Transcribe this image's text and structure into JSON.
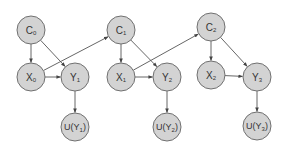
{
  "diagram": {
    "type": "dynamic-bayesian-network",
    "colors": {
      "node_fill": "#d3d3d3",
      "node_stroke": "#707070",
      "edge": "#555555",
      "text": "#333333",
      "background": "#ffffff"
    },
    "nodes": [
      {
        "id": "C0",
        "base": "C",
        "sub": "0",
        "wrap": false,
        "cx": 31,
        "cy": 30
      },
      {
        "id": "X0",
        "base": "X",
        "sub": "0",
        "wrap": false,
        "cx": 31,
        "cy": 77
      },
      {
        "id": "Y1",
        "base": "Y",
        "sub": "1",
        "wrap": false,
        "cx": 75,
        "cy": 77
      },
      {
        "id": "UY1",
        "base": "Y",
        "sub": "1",
        "wrap": true,
        "cx": 75,
        "cy": 127
      },
      {
        "id": "C1",
        "base": "C",
        "sub": "1",
        "wrap": false,
        "cx": 121,
        "cy": 30
      },
      {
        "id": "X1",
        "base": "X",
        "sub": "1",
        "wrap": false,
        "cx": 121,
        "cy": 77
      },
      {
        "id": "Y2",
        "base": "Y",
        "sub": "2",
        "wrap": false,
        "cx": 167,
        "cy": 77
      },
      {
        "id": "UY2",
        "base": "Y",
        "sub": "2",
        "wrap": true,
        "cx": 167,
        "cy": 127
      },
      {
        "id": "C2",
        "base": "C",
        "sub": "2",
        "wrap": false,
        "cx": 211,
        "cy": 27
      },
      {
        "id": "X2",
        "base": "X",
        "sub": "2",
        "wrap": false,
        "cx": 211,
        "cy": 75
      },
      {
        "id": "Y3",
        "base": "Y",
        "sub": "3",
        "wrap": false,
        "cx": 257,
        "cy": 77
      },
      {
        "id": "UY3",
        "base": "Y",
        "sub": "3",
        "wrap": true,
        "cx": 257,
        "cy": 126
      }
    ],
    "edges": [
      {
        "from": "C0",
        "to": "X0"
      },
      {
        "from": "C0",
        "to": "Y1"
      },
      {
        "from": "X0",
        "to": "Y1"
      },
      {
        "from": "X0",
        "to": "C1"
      },
      {
        "from": "Y1",
        "to": "UY1"
      },
      {
        "from": "C1",
        "to": "X1"
      },
      {
        "from": "C1",
        "to": "Y2"
      },
      {
        "from": "X1",
        "to": "Y2"
      },
      {
        "from": "X1",
        "to": "C2"
      },
      {
        "from": "Y2",
        "to": "UY2"
      },
      {
        "from": "C2",
        "to": "X2"
      },
      {
        "from": "C2",
        "to": "Y3"
      },
      {
        "from": "X2",
        "to": "Y3"
      },
      {
        "from": "Y3",
        "to": "UY3"
      }
    ],
    "node_radius": 14,
    "utility_prefix": "U("
  }
}
